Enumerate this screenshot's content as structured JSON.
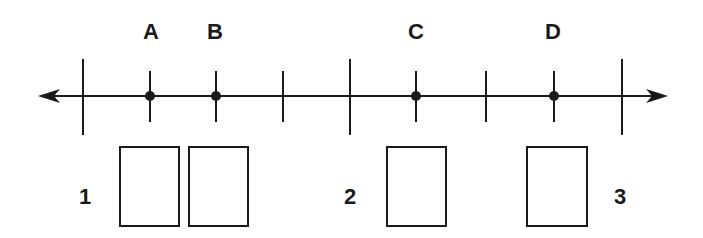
{
  "diagram": {
    "type": "number-line",
    "axis": {
      "y": 96,
      "x_start": 38,
      "x_end": 668,
      "color": "#1a1a1a",
      "arrows": "both"
    },
    "major_ticks": [
      {
        "x": 83,
        "value": "1"
      },
      {
        "x": 350,
        "value": "2"
      },
      {
        "x": 622,
        "value": "3"
      }
    ],
    "minor_ticks": [
      150,
      216,
      283,
      416,
      486,
      554
    ],
    "points": [
      {
        "label": "A",
        "x": 150
      },
      {
        "label": "B",
        "x": 216
      },
      {
        "label": "C",
        "x": 416
      },
      {
        "label": "D",
        "x": 554
      }
    ],
    "number_labels": [
      {
        "text": "1",
        "x": 85,
        "y": 197
      },
      {
        "text": "2",
        "x": 350,
        "y": 197
      },
      {
        "text": "3",
        "x": 620,
        "y": 197
      }
    ],
    "answer_boxes": [
      {
        "for": "A",
        "x": 119,
        "y": 146,
        "w": 61,
        "h": 81,
        "value": ""
      },
      {
        "for": "B",
        "x": 188,
        "y": 146,
        "w": 61,
        "h": 81,
        "value": ""
      },
      {
        "for": "C",
        "x": 386,
        "y": 146,
        "w": 61,
        "h": 81,
        "value": ""
      },
      {
        "for": "D",
        "x": 526,
        "y": 146,
        "w": 62,
        "h": 81,
        "value": ""
      }
    ]
  }
}
